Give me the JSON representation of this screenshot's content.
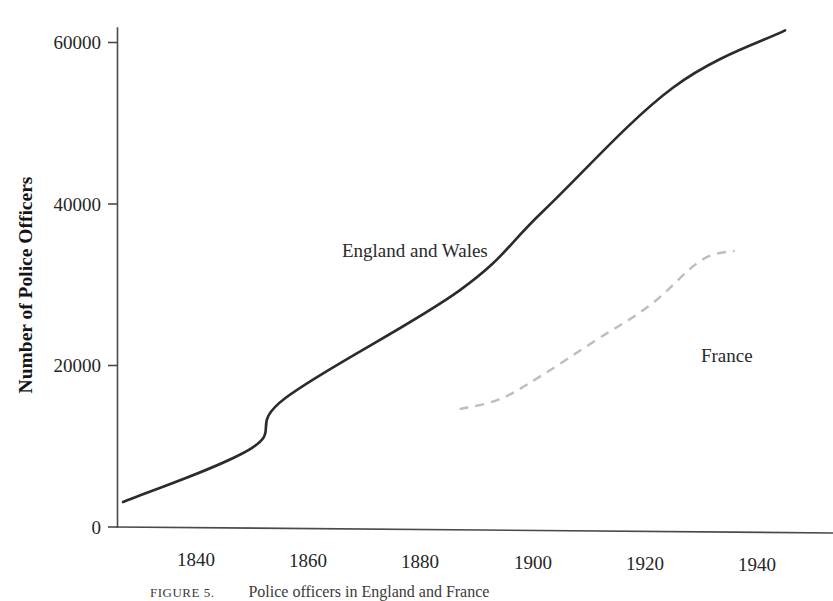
{
  "chart_data": {
    "type": "line",
    "title": "",
    "subtitle": "",
    "xlabel": "",
    "ylabel": "Number of Police Officers",
    "xlim": [
      1827,
      1945
    ],
    "ylim": [
      0,
      64000
    ],
    "grid": false,
    "legend_position": "inline-annotation",
    "x_ticks": [
      1840,
      1860,
      1880,
      1900,
      1920,
      1940
    ],
    "x_tick_labels": [
      "1840",
      "1860",
      "1880",
      "1900",
      "1920",
      "1940"
    ],
    "y_ticks": [
      0,
      20000,
      40000,
      60000
    ],
    "y_tick_labels": [
      "0",
      "20000",
      "40000",
      "60000"
    ],
    "series": [
      {
        "name": "England and Wales",
        "style": "solid",
        "color": "#2b2b2b",
        "label_text": "England and Wales",
        "x": [
          1827,
          1850,
          1856,
          1887,
          1902,
          1925,
          1945
        ],
        "values": [
          3100,
          9800,
          16000,
          29300,
          39200,
          54400,
          61500
        ]
      },
      {
        "name": "France",
        "style": "dashed",
        "color": "#bdbdbd",
        "label_text": "France",
        "x": [
          1887,
          1894,
          1901,
          1911,
          1921,
          1930,
          1936
        ],
        "values": [
          14600,
          15800,
          18500,
          23000,
          27500,
          33000,
          34200
        ]
      }
    ],
    "annotations": [
      {
        "text": "England and Wales",
        "x": 1866,
        "y": 33500
      },
      {
        "text": "France",
        "x": 1930,
        "y": 20500
      }
    ]
  },
  "caption": {
    "tag": "FIGURE 5.",
    "text": "Police officers in England and France"
  }
}
